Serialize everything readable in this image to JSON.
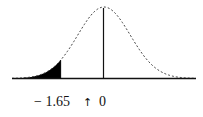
{
  "chart_data": {
    "type": "area",
    "title": "",
    "distribution": "standard-normal",
    "x_range": [
      -3.5,
      3.5
    ],
    "mean": 0,
    "critical_value": -1.65,
    "shaded_region": {
      "from": -3.5,
      "to": -1.65,
      "tail": "left"
    },
    "reference_line_x": 0,
    "tick_labels": [
      "− 1.65",
      "↑",
      "0"
    ],
    "xlabel": "",
    "ylabel": "",
    "grid": false,
    "legend": null,
    "colors": {
      "curve": "#333333",
      "fill": "#000000",
      "axis": "#111111"
    }
  },
  "labels": {
    "critical": "− 1.65",
    "arrow": "↑",
    "center": "0"
  }
}
